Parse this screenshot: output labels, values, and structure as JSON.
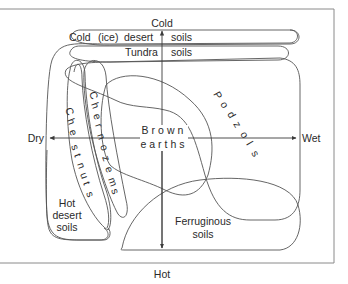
{
  "figure": {
    "type": "soil-zone diagram",
    "frame_color": "#8a8a8a",
    "line_color": "#555555",
    "text_color": "#2a2a2a"
  },
  "axes": {
    "top": "Cold",
    "bottom": "Hot",
    "left": "Dry",
    "right": "Wet"
  },
  "zones": {
    "cold_desert": {
      "words": [
        "Cold",
        "(ice)",
        "desert",
        "soils"
      ]
    },
    "tundra": {
      "words": [
        "Tundra",
        "soils"
      ]
    },
    "chernozems": {
      "letters": [
        "C",
        "h",
        "e",
        "r",
        "n",
        "o",
        "z",
        "e",
        "m",
        "s"
      ]
    },
    "chestnuts": {
      "letters": [
        "C",
        "h",
        "e",
        "s",
        "t",
        "n",
        "u",
        "t",
        "s"
      ]
    },
    "podzols": {
      "letters": [
        "P",
        "o",
        "d",
        "z",
        "o",
        "l",
        "s"
      ]
    },
    "brown_earths": {
      "line1": "Brown",
      "line2": "earths"
    },
    "hot_desert": {
      "line1": "Hot",
      "line2": "desert",
      "line3": "soils"
    },
    "ferruginous": {
      "line1": "Ferruginous",
      "line2": "soils"
    }
  }
}
